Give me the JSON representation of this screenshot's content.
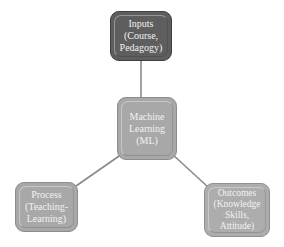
{
  "diagram": {
    "type": "hub-and-spoke",
    "nodes": [
      {
        "id": "inputs",
        "label": "Inputs\n(Course,\nPedagogy)",
        "fill": "#5e5e5e"
      },
      {
        "id": "ml",
        "label": "Machine\nLearning\n(ML)",
        "fill": "#a8a8a8"
      },
      {
        "id": "process",
        "label": "Process\n(Teaching-\nLearning)",
        "fill": "#a8a8a8"
      },
      {
        "id": "outcomes",
        "label": "Outcomes\n(Knowledge\nSkills,\nAttitude)",
        "fill": "#adadad"
      }
    ],
    "edges": [
      {
        "from": "ml",
        "to": "inputs"
      },
      {
        "from": "ml",
        "to": "process"
      },
      {
        "from": "ml",
        "to": "outcomes"
      }
    ],
    "line_color": "#8a8a8a"
  }
}
